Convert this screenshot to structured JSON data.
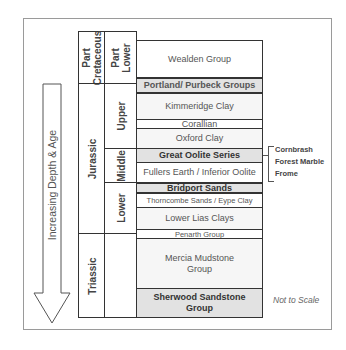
{
  "diagram": {
    "type": "stratigraphic column",
    "arrow_label": "Increasing Depth & Age",
    "note": "Not to Scale",
    "periods": [
      {
        "label": "Part Cretaceous",
        "lines": [
          "Part",
          "Cretaceous"
        ]
      },
      {
        "label": "Jurassic"
      },
      {
        "label": "Triassic"
      }
    ],
    "epochs": [
      {
        "label": "Part Lower",
        "lines": [
          "Part",
          "Lower"
        ]
      },
      {
        "label": "Upper"
      },
      {
        "label": "Middle"
      },
      {
        "label": "Lower"
      }
    ],
    "units": [
      {
        "name": "Wealden Group"
      },
      {
        "name": "Portland/ Purbeck Groups"
      },
      {
        "name": "Kimmeridge Clay"
      },
      {
        "name": "Corallian"
      },
      {
        "name": "Oxford Clay"
      },
      {
        "name": "Great Oolite Series"
      },
      {
        "name": "Fullers Earth / Inferior Oolite"
      },
      {
        "name": "Bridport Sands"
      },
      {
        "name": "Thorncombe Sands / Eype Clay"
      },
      {
        "name": "Lower Lias Clays"
      },
      {
        "name": "Penarth Group"
      },
      {
        "name": "Mercia Mudstone Group",
        "lines": [
          "Mercia Mudstone",
          "Group"
        ]
      },
      {
        "name": "Sherwood Sandstone Group",
        "lines": [
          "Sherwood Sandstone",
          "Group"
        ]
      }
    ],
    "great_oolite_members": [
      "Cornbrash",
      "Forest Marble",
      "Frome"
    ]
  }
}
